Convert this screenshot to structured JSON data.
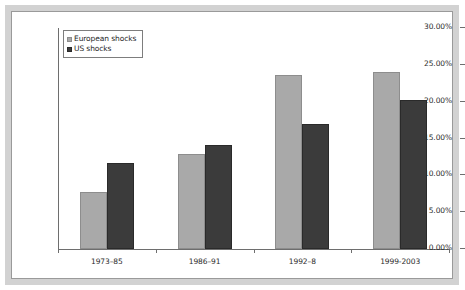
{
  "chart_data": {
    "type": "bar",
    "title": "",
    "subtitle": "",
    "xlabel": "",
    "ylabel": "",
    "categories": [
      "1973–85",
      "1986–91",
      "1992–8",
      "1999-2003"
    ],
    "series": [
      {
        "name": "European shocks",
        "values": [
          7.7,
          12.9,
          23.6,
          24.0
        ],
        "color": "#a9a9a9"
      },
      {
        "name": "US shocks",
        "values": [
          11.7,
          14.1,
          17.0,
          20.2
        ],
        "color": "#3b3b3b"
      }
    ],
    "ylim": [
      0,
      30
    ],
    "ytick_values": [
      0,
      5,
      10,
      15,
      20,
      25,
      30
    ],
    "ytick_labels": [
      "0.00%",
      "5.00%",
      "10.00%",
      "15.00%",
      "20.00%",
      "25.00%",
      "30.00%"
    ],
    "grid": false,
    "legend_position": "top-left-inside",
    "value_format": "percent"
  },
  "legend": {
    "entries": [
      {
        "label": "European shocks",
        "swatch": "series-eu"
      },
      {
        "label": "US shocks",
        "swatch": "series-us"
      }
    ]
  },
  "colors": {
    "series_european": "#a9a9a9",
    "series_us": "#3b3b3b",
    "axis": "#6e6e6e",
    "frame": "#d2d2d2",
    "plot_background": "#ffffff"
  }
}
